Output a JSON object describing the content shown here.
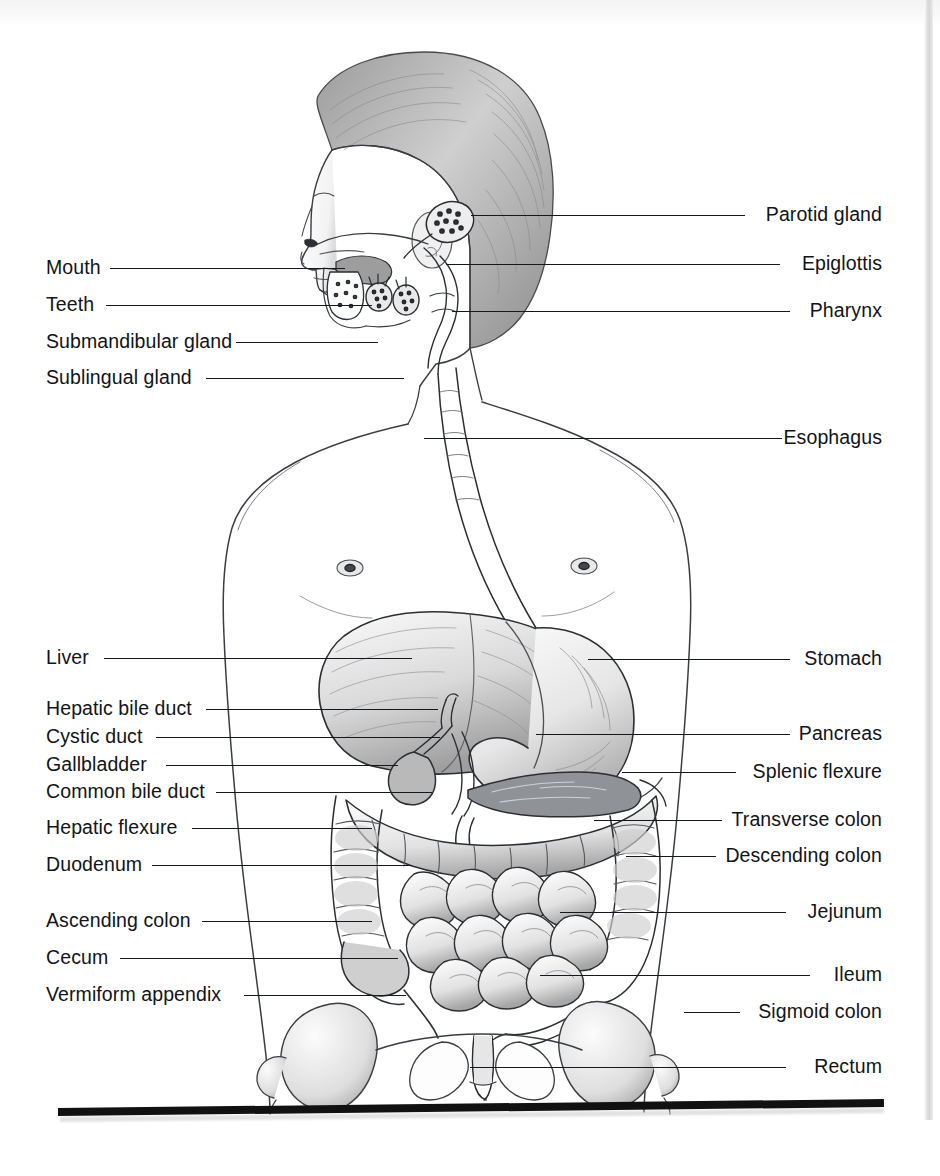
{
  "figure": {
    "kind": "anatomical-illustration",
    "style": "pencil / halftone shaded line drawing",
    "colors": {
      "ink": "#15181c",
      "label_text": "#111418",
      "paper": "#ffffff",
      "gutter_gray": "#d2d2d2",
      "rule_black": "#111111"
    }
  },
  "labels_left": [
    {
      "id": "mouth",
      "text": "Mouth",
      "y": 268,
      "line_from": 110,
      "line_to": 345
    },
    {
      "id": "teeth",
      "text": "Teeth",
      "y": 305,
      "line_from": 106,
      "line_to": 372
    },
    {
      "id": "submandibular-gland",
      "text": "Submandibular gland",
      "y": 342,
      "line_from": 236,
      "line_to": 378
    },
    {
      "id": "sublingual-gland",
      "text": "Sublingual gland",
      "y": 378,
      "line_from": 206,
      "line_to": 404
    },
    {
      "id": "liver",
      "text": "Liver",
      "y": 658,
      "line_from": 104,
      "line_to": 412
    },
    {
      "id": "hepatic-bile-duct",
      "text": "Hepatic bile duct",
      "y": 709,
      "line_from": 206,
      "line_to": 438
    },
    {
      "id": "cystic-duct",
      "text": "Cystic duct",
      "y": 737,
      "line_from": 156,
      "line_to": 440
    },
    {
      "id": "gallbladder",
      "text": "Gallbladder",
      "y": 765,
      "line_from": 166,
      "line_to": 398
    },
    {
      "id": "common-bile-duct",
      "text": "Common bile duct",
      "y": 792,
      "line_from": 216,
      "line_to": 432
    },
    {
      "id": "hepatic-flexure",
      "text": "Hepatic flexure",
      "y": 828,
      "line_from": 192,
      "line_to": 372
    },
    {
      "id": "duodenum",
      "text": "Duodenum",
      "y": 865,
      "line_from": 152,
      "line_to": 412
    },
    {
      "id": "ascending-colon",
      "text": "Ascending colon",
      "y": 921,
      "line_from": 202,
      "line_to": 372
    },
    {
      "id": "cecum",
      "text": "Cecum",
      "y": 958,
      "line_from": 120,
      "line_to": 398
    },
    {
      "id": "vermiform-appendix",
      "text": "Vermiform appendix",
      "y": 995,
      "line_from": 244,
      "line_to": 406
    }
  ],
  "labels_right": [
    {
      "id": "parotid-gland",
      "text": "Parotid gland",
      "y": 215,
      "line_from": 471,
      "line_to": 745
    },
    {
      "id": "epiglottis",
      "text": "Epiglottis",
      "y": 264,
      "line_from": 446,
      "line_to": 780
    },
    {
      "id": "pharynx",
      "text": "Pharynx",
      "y": 311,
      "line_from": 452,
      "line_to": 790
    },
    {
      "id": "esophagus",
      "text": "Esophagus",
      "y": 438,
      "line_from": 424,
      "line_to": 782
    },
    {
      "id": "stomach",
      "text": "Stomach",
      "y": 659,
      "line_from": 588,
      "line_to": 790
    },
    {
      "id": "pancreas",
      "text": "Pancreas",
      "y": 734,
      "line_from": 536,
      "line_to": 790
    },
    {
      "id": "splenic-flexure",
      "text": "Splenic flexure",
      "y": 772,
      "line_from": 622,
      "line_to": 736
    },
    {
      "id": "transverse-colon",
      "text": "Transverse colon",
      "y": 820,
      "line_from": 594,
      "line_to": 722
    },
    {
      "id": "descending-colon",
      "text": "Descending colon",
      "y": 856,
      "line_from": 626,
      "line_to": 716
    },
    {
      "id": "jejunum",
      "text": "Jejunum",
      "y": 912,
      "line_from": 560,
      "line_to": 786
    },
    {
      "id": "ileum",
      "text": "Ileum",
      "y": 975,
      "line_from": 540,
      "line_to": 810
    },
    {
      "id": "sigmoid-colon",
      "text": "Sigmoid colon",
      "y": 1012,
      "line_from": 684,
      "line_to": 740
    },
    {
      "id": "rectum",
      "text": "Rectum",
      "y": 1067,
      "line_from": 470,
      "line_to": 786
    }
  ]
}
